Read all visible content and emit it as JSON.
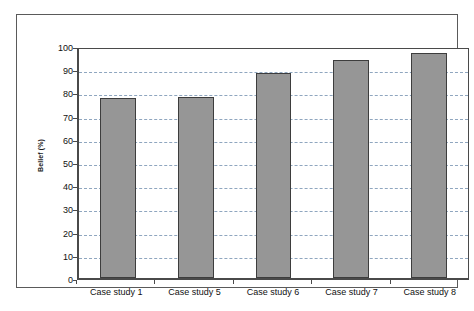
{
  "chart_data": {
    "type": "bar",
    "title": "",
    "subtitle": "",
    "xlabel": "",
    "ylabel": "Belief (%)",
    "categories": [
      "Case study 1",
      "Case study 5",
      "Case study 6",
      "Case study 7",
      "Case study 8"
    ],
    "values": [
      77.5,
      78,
      88.5,
      94,
      97
    ],
    "ylim": [
      0,
      100
    ],
    "y_ticks": [
      0,
      10,
      20,
      30,
      40,
      50,
      60,
      70,
      80,
      90,
      100
    ],
    "y_tick_labels": [
      "0",
      "10",
      "20",
      "30",
      "40",
      "50",
      "60",
      "70",
      "80",
      "90",
      "100"
    ],
    "grid": true,
    "grid_axis": "y",
    "grid_style": "dashed",
    "legend": false,
    "legend_position": "none",
    "colors": {
      "bar_fill": "#969696",
      "bar_border": "#3d3d3d",
      "gridline": "#8fa6bf",
      "axis": "#4a4a4a",
      "frame": "#5a5a5a",
      "plot_background": "#ffffff",
      "text": "#111111"
    }
  }
}
